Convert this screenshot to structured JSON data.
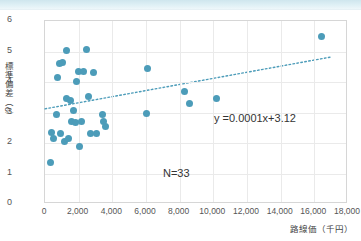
{
  "header": {
    "strip_items": [
      {
        "text": "─────",
        "left": 105
      },
      {
        "text": "────",
        "left": 215
      },
      {
        "text": "─ ──",
        "left": 320
      }
    ]
  },
  "chart_data": {
    "type": "scatter",
    "title": "",
    "xlabel": "路線価（千円）",
    "ylabel": "標準偏差（σ）",
    "xlim": [
      0,
      18000
    ],
    "ylim": [
      0,
      6
    ],
    "xticks": [
      0,
      2000,
      4000,
      6000,
      8000,
      10000,
      12000,
      14000,
      16000,
      18000
    ],
    "xtick_labels": [
      "0",
      "2,000",
      "4,000",
      "6,000",
      "8,000",
      "10,000",
      "12,000",
      "14,000",
      "16,000",
      "18,000"
    ],
    "yticks": [
      0,
      1,
      2,
      3,
      4,
      5,
      6
    ],
    "ytick_labels": [
      "0",
      "1",
      "2",
      "3",
      "4",
      "5",
      "6"
    ],
    "grid": true,
    "legend": false,
    "marker_color": "#4c9cb9",
    "trendline": {
      "equation": "y =0.0001x+3.12",
      "slope": 0.0001,
      "intercept": 3.12,
      "style": "dotted",
      "color": "#4c9cb9",
      "x_start": 0,
      "x_end": 17000
    },
    "annotations": [
      {
        "text": "y =0.0001x+3.12",
        "name": "regression-equation"
      },
      {
        "text": "N=33",
        "name": "sample-size"
      }
    ],
    "n": 33,
    "points": [
      {
        "x": 300,
        "y": 1.35
      },
      {
        "x": 380,
        "y": 2.35
      },
      {
        "x": 520,
        "y": 2.15
      },
      {
        "x": 700,
        "y": 2.95
      },
      {
        "x": 760,
        "y": 4.15
      },
      {
        "x": 860,
        "y": 4.62
      },
      {
        "x": 900,
        "y": 2.3
      },
      {
        "x": 1050,
        "y": 4.63
      },
      {
        "x": 1150,
        "y": 2.05
      },
      {
        "x": 1250,
        "y": 3.45
      },
      {
        "x": 1300,
        "y": 5.02
      },
      {
        "x": 1420,
        "y": 2.15
      },
      {
        "x": 1500,
        "y": 3.38
      },
      {
        "x": 1560,
        "y": 2.72
      },
      {
        "x": 1700,
        "y": 3.05
      },
      {
        "x": 1800,
        "y": 2.68
      },
      {
        "x": 1850,
        "y": 4.02
      },
      {
        "x": 2000,
        "y": 4.36
      },
      {
        "x": 2050,
        "y": 1.9
      },
      {
        "x": 2180,
        "y": 2.7
      },
      {
        "x": 2300,
        "y": 4.35
      },
      {
        "x": 2450,
        "y": 5.08
      },
      {
        "x": 2600,
        "y": 3.52
      },
      {
        "x": 2700,
        "y": 2.3
      },
      {
        "x": 2900,
        "y": 4.3
      },
      {
        "x": 3050,
        "y": 2.3
      },
      {
        "x": 3400,
        "y": 2.95
      },
      {
        "x": 3450,
        "y": 2.72
      },
      {
        "x": 3600,
        "y": 2.55
      },
      {
        "x": 6000,
        "y": 2.98
      },
      {
        "x": 6100,
        "y": 4.45
      },
      {
        "x": 8300,
        "y": 3.7
      },
      {
        "x": 8600,
        "y": 3.28
      },
      {
        "x": 10200,
        "y": 3.45
      },
      {
        "x": 16400,
        "y": 5.48
      }
    ]
  }
}
